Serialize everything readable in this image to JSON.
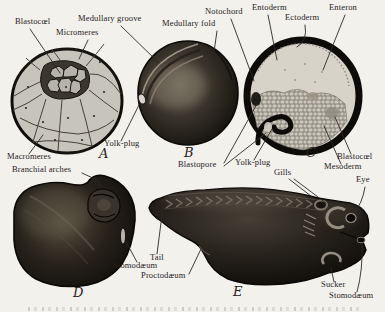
{
  "page": {
    "background_color": "#f3f1ec",
    "ink_color": "#26221c",
    "figure_fill_light": "#c7c4bc",
    "figure_fill_dark": "#14110d",
    "description_of_visible_content": "Engraved textbook plate of five frog-embryo stages labelled A-E with anatomical leader-line labels"
  },
  "labels": {
    "blastocoel_a": "Blastocœl",
    "micromeres": "Micromeres",
    "medullary_groove": "Medullary groove",
    "medullary_fold": "Medullary fold",
    "notochord": "Notochord",
    "entoderm": "Entoderm",
    "ectoderm": "Ectoderm",
    "enteron": "Enteron",
    "macromeres": "Macromeres",
    "yolk_plug_b": "Yolk-plug",
    "blastopore": "Blastopore",
    "yolk_plug_c": "Yolk-plug",
    "blastocoel_c": "Blastocœl",
    "mesoderm": "Mesoderm",
    "gills": "Gills",
    "eye": "Eye",
    "branchial_arches": "Branchial arches",
    "tail": "Tail",
    "stomodaeum_d": "Stomodæum",
    "proctodaeum": "Proctodæum",
    "sucker": "Sucker",
    "stomodaeum_e": "Stomodæum"
  },
  "panel_letters": {
    "a": "A",
    "b": "B",
    "c": "C",
    "d": "D",
    "e": "E"
  }
}
